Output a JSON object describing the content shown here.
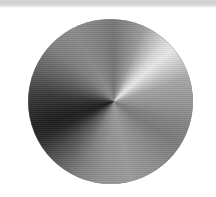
{
  "scene": {
    "kind": "conic-gradient-disc",
    "description": "Brushed-metal style disc rendered as an angular (conic) gradient on a white field",
    "canvas_width": 216,
    "canvas_height": 197,
    "background_color": "#ffffff"
  },
  "top_band": {
    "name": "top-gray-band",
    "top": 0,
    "height": 8,
    "color": "#d8d8d8",
    "hairline_color": "#cfcfcf",
    "fade_to": "#ffffff"
  },
  "disc": {
    "name": "gradient-disc",
    "left": 28,
    "top": 19,
    "diameter": 165,
    "center_x": 110,
    "center_y": 101,
    "singularity_x": 113,
    "singularity_y": 101,
    "singularity_offset_pct_x": 52,
    "singularity_offset_pct_y": 50,
    "rim_color": "#8c8c8c",
    "texture": "horizontal-scanline-banding"
  },
  "chart_data": {
    "type": "pie",
    "title": "",
    "subtitle": "",
    "xlabel": "",
    "ylabel": "",
    "legend_position": "none",
    "grid": false,
    "categories": [
      "0deg",
      "30deg",
      "45deg",
      "60deg",
      "90deg",
      "120deg",
      "150deg",
      "180deg",
      "210deg",
      "240deg",
      "250deg",
      "270deg",
      "300deg",
      "330deg",
      "360deg"
    ],
    "values": [
      117,
      160,
      232,
      206,
      150,
      122,
      140,
      154,
      128,
      72,
      30,
      52,
      120,
      135,
      117
    ],
    "series": [
      {
        "name": "luminance",
        "values": [
          117,
          160,
          232,
          206,
          150,
          122,
          140,
          154,
          128,
          72,
          30,
          52,
          120,
          135,
          117
        ]
      }
    ],
    "stops": [
      {
        "angle_deg": 0,
        "color": "#757575",
        "label": "top-center"
      },
      {
        "angle_deg": 22,
        "color": "#9a9a9a",
        "label": "upper-right-rise"
      },
      {
        "angle_deg": 40,
        "color": "#d8d8d8",
        "label": "near-highlight"
      },
      {
        "angle_deg": 48,
        "color": "#e8e8e8",
        "label": "highlight-peak"
      },
      {
        "angle_deg": 58,
        "color": "#cecece",
        "label": "highlight-falloff"
      },
      {
        "angle_deg": 72,
        "color": "#a6a6a6",
        "label": "right-upper"
      },
      {
        "angle_deg": 90,
        "color": "#969696",
        "label": "right"
      },
      {
        "angle_deg": 108,
        "color": "#838383",
        "label": "right-lower"
      },
      {
        "angle_deg": 124,
        "color": "#7a7a7a",
        "label": "lower-right"
      },
      {
        "angle_deg": 145,
        "color": "#8c8c8c",
        "label": "bottom-right"
      },
      {
        "angle_deg": 168,
        "color": "#9a9a9a",
        "label": "bottom-center"
      },
      {
        "angle_deg": 188,
        "color": "#929292",
        "label": "bottom-left-upper"
      },
      {
        "angle_deg": 205,
        "color": "#808080",
        "label": "lower-left"
      },
      {
        "angle_deg": 228,
        "color": "#4e4e4e",
        "label": "dark-ramp"
      },
      {
        "angle_deg": 243,
        "color": "#262626",
        "label": "near-darkest"
      },
      {
        "angle_deg": 252,
        "color": "#1e1e1e",
        "label": "darkest"
      },
      {
        "angle_deg": 262,
        "color": "#262626",
        "label": "dark-recover"
      },
      {
        "angle_deg": 275,
        "color": "#383838",
        "label": "left"
      },
      {
        "angle_deg": 292,
        "color": "#5e5e5e",
        "label": "left-upper"
      },
      {
        "angle_deg": 312,
        "color": "#7e7e7e",
        "label": "upper-left"
      },
      {
        "angle_deg": 330,
        "color": "#8a8a8a",
        "label": "upper-left-bright"
      },
      {
        "angle_deg": 345,
        "color": "#828282",
        "label": "top-left"
      },
      {
        "angle_deg": 360,
        "color": "#757575",
        "label": "top-center-wrap"
      }
    ],
    "min_luminance": 30,
    "max_luminance": 232,
    "darkest_color": "#1e1e1e",
    "brightest_color": "#e8e8e8",
    "darkest_angle_deg": 252,
    "brightest_angle_deg": 48
  }
}
